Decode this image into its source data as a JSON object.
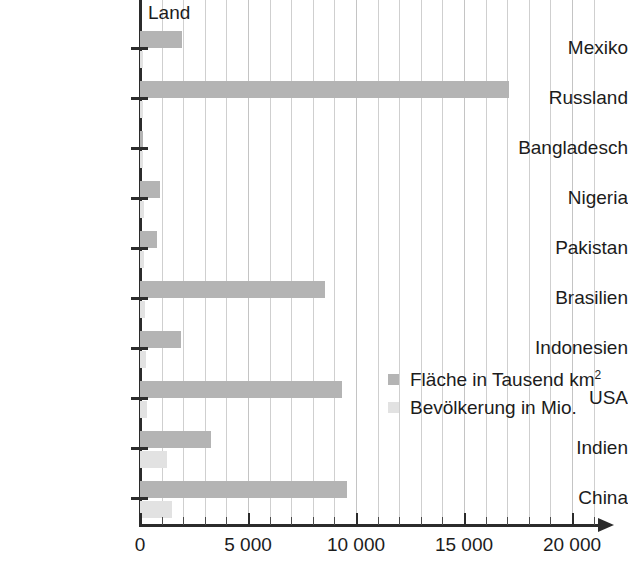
{
  "chart_data": {
    "type": "bar",
    "orientation": "horizontal",
    "title": "",
    "series_header": "Land",
    "xlabel": "",
    "ylabel": "Land",
    "xlim": [
      0,
      21000
    ],
    "grid": true,
    "legend_position": "center-right",
    "x_ticks": [
      "0",
      "5 000",
      "10 000",
      "15 000",
      "20 000"
    ],
    "x_tick_values": [
      0,
      5000,
      10000,
      15000,
      20000
    ],
    "x_minor_step": 1000,
    "categories": [
      "Mexiko",
      "Russland",
      "Bangladesch",
      "Nigeria",
      "Pakistan",
      "Brasilien",
      "Indonesien",
      "USA",
      "Indien",
      "China"
    ],
    "series": [
      {
        "name": "Fläche in Tausend km²",
        "key": "area",
        "color": "#b4b4b4",
        "values": [
          1958,
          17075,
          144,
          924,
          796,
          8547,
          1905,
          9363,
          3287,
          9597
        ]
      },
      {
        "name": "Bevölkerung in Mio.",
        "key": "population",
        "color": "#e2e2e2",
        "values": [
          108,
          142,
          147,
          149,
          166,
          190,
          232,
          304,
          1150,
          1330
        ]
      }
    ]
  },
  "legend": {
    "items": [
      {
        "label_prefix": "Fläche in Tausend km",
        "superscript": "2",
        "swatch": "area"
      },
      {
        "label_prefix": "Bevölkerung in Mio.",
        "superscript": "",
        "swatch": "pop"
      }
    ]
  },
  "colors": {
    "axis": "#2b2b2b",
    "grid": "#cfcfcf",
    "area_bar": "#b4b4b4",
    "population_bar": "#e2e2e2",
    "text": "#1c1c1c",
    "background": "#ffffff"
  }
}
